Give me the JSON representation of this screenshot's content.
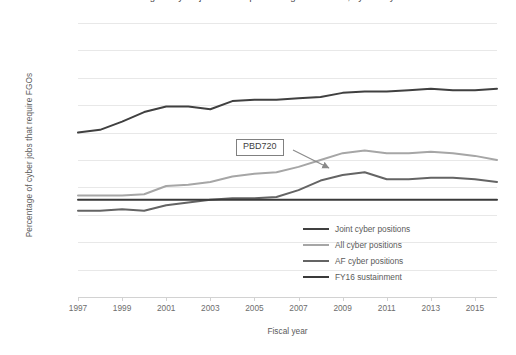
{
  "chart_data": {
    "type": "line",
    "title": "Percentage of cyber jobs that require field grade officers, by fiscal year",
    "xlabel": "Fiscal year",
    "ylabel": "Percentage of cyber jobs that require FGOs",
    "xlim": [
      1997,
      2016
    ],
    "ylim": [
      0,
      100
    ],
    "ytick_step": 10,
    "xtick_step": 2,
    "grid": true,
    "legend_position": "inside-bottom-right",
    "x": [
      1997,
      1998,
      1999,
      2000,
      2001,
      2002,
      2003,
      2004,
      2005,
      2006,
      2007,
      2008,
      2009,
      2010,
      2011,
      2012,
      2013,
      2014,
      2015,
      2016
    ],
    "xticks": [
      "1997",
      "1999",
      "2001",
      "2003",
      "2005",
      "2007",
      "2009",
      "2011",
      "2013",
      "2015"
    ],
    "yticks": [
      "0",
      "10",
      "20",
      "30",
      "40",
      "50",
      "60",
      "70",
      "80",
      "90",
      "100"
    ],
    "series": [
      {
        "name": "Joint cyber positions",
        "color": "#404040",
        "values": [
          60.0,
          61.0,
          64.0,
          67.5,
          69.5,
          69.5,
          68.5,
          71.5,
          72.0,
          72.0,
          72.5,
          73.0,
          74.5,
          75.0,
          75.0,
          75.5,
          76.0,
          75.5,
          75.5,
          76.0
        ]
      },
      {
        "name": "All cyber positions",
        "color": "#a6a6a6",
        "values": [
          37.0,
          37.0,
          37.0,
          37.5,
          40.5,
          41.0,
          42.0,
          44.0,
          45.0,
          45.5,
          47.5,
          50.0,
          52.5,
          53.5,
          52.5,
          52.5,
          53.0,
          52.5,
          51.5,
          50.0
        ]
      },
      {
        "name": "AF cyber positions",
        "color": "#646464",
        "values": [
          31.5,
          31.5,
          32.0,
          31.5,
          33.5,
          34.5,
          35.5,
          36.0,
          36.0,
          36.5,
          39.0,
          42.5,
          44.5,
          45.5,
          43.0,
          43.0,
          43.5,
          43.5,
          43.0,
          42.0
        ]
      },
      {
        "name": "FY16 sustainment",
        "color": "#3a3a3a",
        "values": [
          35.5,
          35.5,
          35.5,
          35.5,
          35.5,
          35.5,
          35.5,
          35.5,
          35.5,
          35.5,
          35.5,
          35.5,
          35.5,
          35.5,
          35.5,
          35.5,
          35.5,
          35.5,
          35.5,
          35.5
        ]
      }
    ],
    "annotations": [
      {
        "label": "PBD720",
        "points_to_year": 2008,
        "points_to_value": 50.0
      }
    ]
  },
  "legend": {
    "items": [
      {
        "label": "Joint cyber positions",
        "color": "#404040"
      },
      {
        "label": "All cyber positions",
        "color": "#a6a6a6"
      },
      {
        "label": "AF cyber positions",
        "color": "#646464"
      },
      {
        "label": "FY16 sustainment",
        "color": "#3a3a3a"
      }
    ]
  }
}
